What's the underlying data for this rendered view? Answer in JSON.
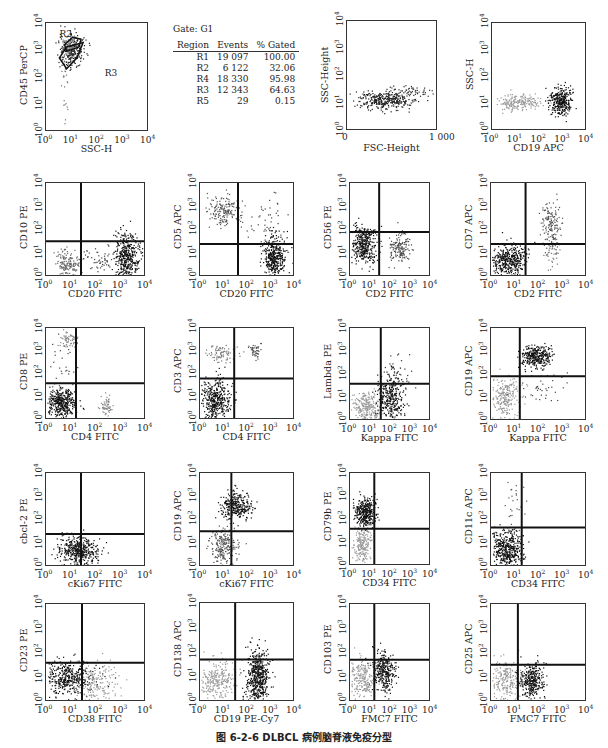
{
  "caption": "图 6-2-6   DLBCL 病例脑脊液免疫分型",
  "gate_table": {
    "title": "Gate: G1",
    "headers": [
      "Region",
      "Events",
      "% Gated"
    ],
    "rows": [
      [
        "R1",
        "19 097",
        "100.00"
      ],
      [
        "R2",
        "6 122",
        "32.06"
      ],
      [
        "R4",
        "18 330",
        "95.98"
      ],
      [
        "R3",
        "12 343",
        "64.63"
      ],
      [
        "R5",
        "29",
        "0.15"
      ]
    ]
  },
  "chart_data": [
    {
      "id": "p1",
      "type": "scatter",
      "xlabel": "SSC-H",
      "ylabel": "CD45 PerCP",
      "xscale": "log",
      "xlim": [
        1,
        10000
      ],
      "ylim": [
        1,
        10000
      ],
      "x_ticks": [
        "10^0",
        "10^1",
        "10^2",
        "10^3",
        "10^4"
      ],
      "y_ticks": [
        "10^0",
        "10^1",
        "10^2",
        "10^3",
        "10^4"
      ],
      "frame": [
        45,
        22,
        103,
        109
      ],
      "gate_labels": [
        {
          "text": "R2",
          "x": 0.14,
          "y": 0.12
        },
        {
          "text": "R3",
          "x": 0.58,
          "y": 0.48
        }
      ],
      "clusters": [
        {
          "cx": 0.25,
          "cy": 0.25,
          "sx": 0.06,
          "sy": 0.08,
          "n": 260,
          "c": "#222"
        },
        {
          "cx": 0.22,
          "cy": 0.2,
          "sx": 0.04,
          "sy": 0.04,
          "n": 80,
          "c": "#888"
        },
        {
          "cx": 0.18,
          "cy": 0.55,
          "sx": 0.02,
          "sy": 0.2,
          "n": 20,
          "c": "#777"
        }
      ],
      "quadrant": null
    },
    {
      "id": "p2",
      "type": "scatter",
      "xlabel": "FSC-Height",
      "ylabel": "SSC-Height",
      "xscale": "linear",
      "xlim": [
        0,
        1000
      ],
      "ylim": [
        1,
        10000
      ],
      "x_ticks": [
        "0",
        "1 000"
      ],
      "y_ticks": [
        "10^0",
        "10^1",
        "10^2",
        "10^3",
        "10^4"
      ],
      "frame": [
        346,
        20,
        91,
        110
      ],
      "clusters": [
        {
          "cx": 0.4,
          "cy": 0.72,
          "sx": 0.15,
          "sy": 0.04,
          "n": 350,
          "c": "#222"
        },
        {
          "cx": 0.7,
          "cy": 0.64,
          "sx": 0.1,
          "sy": 0.03,
          "n": 60,
          "c": "#333"
        }
      ],
      "quadrant": null
    },
    {
      "id": "p3",
      "type": "scatter",
      "xlabel": "CD19 APC",
      "ylabel": "SSC-H",
      "xlim": [
        1,
        10000
      ],
      "ylim": [
        1,
        10000
      ],
      "x_ticks": [
        "10^0",
        "10^1",
        "10^2",
        "10^3",
        "10^4"
      ],
      "y_ticks": [
        "10^0",
        "10^1",
        "10^2",
        "10^3",
        "10^4"
      ],
      "frame": [
        491,
        22,
        95,
        108
      ],
      "clusters": [
        {
          "cx": 0.27,
          "cy": 0.73,
          "sx": 0.12,
          "sy": 0.04,
          "n": 200,
          "c": "#999"
        },
        {
          "cx": 0.72,
          "cy": 0.72,
          "sx": 0.06,
          "sy": 0.06,
          "n": 320,
          "c": "#111"
        }
      ],
      "quadrant": null
    },
    {
      "id": "p4",
      "type": "scatter",
      "xlabel": "CD20 FITC",
      "ylabel": "CD10 PE",
      "xlim": [
        1,
        10000
      ],
      "ylim": [
        1,
        10000
      ],
      "x_ticks": [
        "10^0",
        "10^1",
        "10^2",
        "10^3",
        "10^4"
      ],
      "y_ticks": [
        "10^0",
        "10^1",
        "10^2",
        "10^3",
        "10^4"
      ],
      "frame": [
        45,
        182,
        100,
        94
      ],
      "quadrant": [
        0.35,
        0.62
      ],
      "clusters": [
        {
          "cx": 0.22,
          "cy": 0.86,
          "sx": 0.07,
          "sy": 0.07,
          "n": 160,
          "c": "#666"
        },
        {
          "cx": 0.8,
          "cy": 0.78,
          "sx": 0.06,
          "sy": 0.12,
          "n": 420,
          "c": "#111"
        },
        {
          "cx": 0.55,
          "cy": 0.82,
          "sx": 0.12,
          "sy": 0.08,
          "n": 60,
          "c": "#444"
        }
      ]
    },
    {
      "id": "p5",
      "type": "scatter",
      "xlabel": "CD20 FITC",
      "ylabel": "CD5 APC",
      "xlim": [
        1,
        10000
      ],
      "ylim": [
        1,
        10000
      ],
      "x_ticks": [
        "10^0",
        "10^1",
        "10^2",
        "10^3",
        "10^4"
      ],
      "y_ticks": [
        "10^0",
        "10^1",
        "10^2",
        "10^3",
        "10^4"
      ],
      "frame": [
        199,
        182,
        95,
        94
      ],
      "quadrant": [
        0.4,
        0.65
      ],
      "clusters": [
        {
          "cx": 0.25,
          "cy": 0.3,
          "sx": 0.09,
          "sy": 0.08,
          "n": 180,
          "c": "#555"
        },
        {
          "cx": 0.78,
          "cy": 0.8,
          "sx": 0.06,
          "sy": 0.12,
          "n": 400,
          "c": "#111"
        },
        {
          "cx": 0.7,
          "cy": 0.35,
          "sx": 0.12,
          "sy": 0.12,
          "n": 40,
          "c": "#444"
        }
      ]
    },
    {
      "id": "p6",
      "type": "scatter",
      "xlabel": "CD2 FITC",
      "ylabel": "CD56 PE",
      "xlim": [
        1,
        10000
      ],
      "ylim": [
        1,
        10000
      ],
      "x_ticks": [
        "10^0",
        "10^1",
        "10^2",
        "10^3",
        "10^4"
      ],
      "y_ticks": [
        "10^0",
        "10^1",
        "10^2",
        "10^3",
        "10^4"
      ],
      "frame": [
        349,
        182,
        81,
        94
      ],
      "quadrant": [
        0.36,
        0.52
      ],
      "clusters": [
        {
          "cx": 0.17,
          "cy": 0.65,
          "sx": 0.08,
          "sy": 0.1,
          "n": 380,
          "c": "#111"
        },
        {
          "cx": 0.6,
          "cy": 0.68,
          "sx": 0.06,
          "sy": 0.08,
          "n": 140,
          "c": "#444"
        }
      ]
    },
    {
      "id": "p7",
      "type": "scatter",
      "xlabel": "CD2 FITC",
      "ylabel": "CD7 APC",
      "xlim": [
        1,
        10000
      ],
      "ylim": [
        1,
        10000
      ],
      "x_ticks": [
        "10^0",
        "10^1",
        "10^2",
        "10^3",
        "10^4"
      ],
      "y_ticks": [
        "10^0",
        "10^1",
        "10^2",
        "10^3",
        "10^4"
      ],
      "frame": [
        490,
        182,
        96,
        94
      ],
      "quadrant": [
        0.36,
        0.65
      ],
      "clusters": [
        {
          "cx": 0.18,
          "cy": 0.82,
          "sx": 0.09,
          "sy": 0.08,
          "n": 420,
          "c": "#111"
        },
        {
          "cx": 0.62,
          "cy": 0.42,
          "sx": 0.05,
          "sy": 0.12,
          "n": 150,
          "c": "#555"
        },
        {
          "cx": 0.62,
          "cy": 0.72,
          "sx": 0.04,
          "sy": 0.1,
          "n": 50,
          "c": "#777"
        }
      ]
    },
    {
      "id": "p8",
      "type": "scatter",
      "xlabel": "CD4 FITC",
      "ylabel": "CD8 PE",
      "xlim": [
        1,
        10000
      ],
      "ylim": [
        1,
        10000
      ],
      "x_ticks": [
        "10^0",
        "10^1",
        "10^2",
        "10^3",
        "10^4"
      ],
      "y_ticks": [
        "10^0",
        "10^1",
        "10^2",
        "10^3",
        "10^4"
      ],
      "frame": [
        45,
        327,
        100,
        92
      ],
      "quadrant": [
        0.3,
        0.6
      ],
      "clusters": [
        {
          "cx": 0.15,
          "cy": 0.8,
          "sx": 0.07,
          "sy": 0.08,
          "n": 400,
          "c": "#111"
        },
        {
          "cx": 0.22,
          "cy": 0.12,
          "sx": 0.06,
          "sy": 0.05,
          "n": 70,
          "c": "#888"
        },
        {
          "cx": 0.6,
          "cy": 0.82,
          "sx": 0.03,
          "sy": 0.07,
          "n": 60,
          "c": "#888"
        },
        {
          "cx": 0.15,
          "cy": 0.4,
          "sx": 0.08,
          "sy": 0.15,
          "n": 30,
          "c": "#444"
        }
      ]
    },
    {
      "id": "p9",
      "type": "scatter",
      "xlabel": "CD4 FITC",
      "ylabel": "CD3 APC",
      "xlim": [
        1,
        10000
      ],
      "ylim": [
        1,
        10000
      ],
      "x_ticks": [
        "10^0",
        "10^1",
        "10^2",
        "10^3",
        "10^4"
      ],
      "y_ticks": [
        "10^0",
        "10^1",
        "10^2",
        "10^3",
        "10^4"
      ],
      "frame": [
        199,
        327,
        95,
        92
      ],
      "quadrant": [
        0.36,
        0.55
      ],
      "clusters": [
        {
          "cx": 0.15,
          "cy": 0.78,
          "sx": 0.08,
          "sy": 0.12,
          "n": 420,
          "c": "#111"
        },
        {
          "cx": 0.22,
          "cy": 0.28,
          "sx": 0.08,
          "sy": 0.05,
          "n": 80,
          "c": "#777"
        },
        {
          "cx": 0.57,
          "cy": 0.25,
          "sx": 0.03,
          "sy": 0.05,
          "n": 50,
          "c": "#555"
        }
      ]
    },
    {
      "id": "p10",
      "type": "scatter",
      "xlabel": "Kappa FITC",
      "ylabel": "Lambda PE",
      "xlim": [
        1,
        10000
      ],
      "ylim": [
        1,
        10000
      ],
      "x_ticks": [
        "10^0",
        "10^1",
        "10^2",
        "10^3",
        "10^4"
      ],
      "y_ticks": [
        "10^0",
        "10^1",
        "10^2",
        "10^3",
        "10^4"
      ],
      "frame": [
        349,
        327,
        81,
        93
      ],
      "quadrant": [
        0.38,
        0.6
      ],
      "clusters": [
        {
          "cx": 0.2,
          "cy": 0.85,
          "sx": 0.1,
          "sy": 0.08,
          "n": 260,
          "c": "#999"
        },
        {
          "cx": 0.5,
          "cy": 0.75,
          "sx": 0.08,
          "sy": 0.12,
          "n": 320,
          "c": "#111"
        },
        {
          "cx": 0.6,
          "cy": 0.5,
          "sx": 0.08,
          "sy": 0.1,
          "n": 40,
          "c": "#333"
        }
      ]
    },
    {
      "id": "p11",
      "type": "scatter",
      "xlabel": "Kappa FITC",
      "ylabel": "CD19 APC",
      "xlim": [
        1,
        10000
      ],
      "ylim": [
        1,
        10000
      ],
      "x_ticks": [
        "10^0",
        "10^1",
        "10^2",
        "10^3",
        "10^4"
      ],
      "y_ticks": [
        "10^0",
        "10^1",
        "10^2",
        "10^3",
        "10^4"
      ],
      "frame": [
        490,
        327,
        96,
        93
      ],
      "quadrant": [
        0.3,
        0.52
      ],
      "clusters": [
        {
          "cx": 0.15,
          "cy": 0.75,
          "sx": 0.08,
          "sy": 0.12,
          "n": 260,
          "c": "#999"
        },
        {
          "cx": 0.47,
          "cy": 0.3,
          "sx": 0.08,
          "sy": 0.06,
          "n": 320,
          "c": "#111"
        },
        {
          "cx": 0.55,
          "cy": 0.62,
          "sx": 0.12,
          "sy": 0.1,
          "n": 40,
          "c": "#444"
        }
      ]
    },
    {
      "id": "p12",
      "type": "scatter",
      "xlabel": "cKi67 FITC",
      "ylabel": "cbcl-2 PE",
      "xlim": [
        1,
        10000
      ],
      "ylim": [
        1,
        10000
      ],
      "x_ticks": [
        "10^0",
        "10^1",
        "10^2",
        "10^3",
        "10^4"
      ],
      "y_ticks": [
        "10^0",
        "10^1",
        "10^2",
        "10^3",
        "10^4"
      ],
      "frame": [
        45,
        472,
        100,
        94
      ],
      "quadrant": [
        0.35,
        0.65
      ],
      "clusters": [
        {
          "cx": 0.32,
          "cy": 0.82,
          "sx": 0.1,
          "sy": 0.07,
          "n": 420,
          "c": "#111"
        }
      ]
    },
    {
      "id": "p13",
      "type": "scatter",
      "xlabel": "cKi67 FITC",
      "ylabel": "CD19 APC",
      "xlim": [
        1,
        10000
      ],
      "ylim": [
        1,
        10000
      ],
      "x_ticks": [
        "10^0",
        "10^1",
        "10^2",
        "10^3",
        "10^4"
      ],
      "y_ticks": [
        "10^0",
        "10^1",
        "10^2",
        "10^3",
        "10^4"
      ],
      "frame": [
        199,
        472,
        95,
        94
      ],
      "quadrant": [
        0.33,
        0.62
      ],
      "clusters": [
        {
          "cx": 0.37,
          "cy": 0.35,
          "sx": 0.08,
          "sy": 0.07,
          "n": 300,
          "c": "#111"
        },
        {
          "cx": 0.25,
          "cy": 0.78,
          "sx": 0.07,
          "sy": 0.1,
          "n": 220,
          "c": "#555"
        }
      ]
    },
    {
      "id": "p14",
      "type": "scatter",
      "xlabel": "CD34 FITC",
      "ylabel": "CD79b PE",
      "xlim": [
        1,
        10000
      ],
      "ylim": [
        1,
        10000
      ],
      "x_ticks": [
        "10^0",
        "10^1",
        "10^2",
        "10^3",
        "10^4"
      ],
      "y_ticks": [
        "10^0",
        "10^1",
        "10^2",
        "10^3",
        "10^4"
      ],
      "frame": [
        349,
        472,
        81,
        93
      ],
      "quadrant": [
        0.3,
        0.6
      ],
      "clusters": [
        {
          "cx": 0.18,
          "cy": 0.42,
          "sx": 0.06,
          "sy": 0.08,
          "n": 360,
          "c": "#111"
        },
        {
          "cx": 0.15,
          "cy": 0.78,
          "sx": 0.05,
          "sy": 0.1,
          "n": 200,
          "c": "#999"
        }
      ]
    },
    {
      "id": "p15",
      "type": "scatter",
      "xlabel": "CD34 FITC",
      "ylabel": "CD11c APC",
      "xlim": [
        1,
        10000
      ],
      "ylim": [
        1,
        10000
      ],
      "x_ticks": [
        "10^0",
        "10^1",
        "10^2",
        "10^3",
        "10^4"
      ],
      "y_ticks": [
        "10^0",
        "10^1",
        "10^2",
        "10^3",
        "10^4"
      ],
      "frame": [
        490,
        472,
        96,
        94
      ],
      "quadrant": [
        0.32,
        0.58
      ],
      "clusters": [
        {
          "cx": 0.16,
          "cy": 0.8,
          "sx": 0.08,
          "sy": 0.1,
          "n": 440,
          "c": "#111"
        },
        {
          "cx": 0.2,
          "cy": 0.35,
          "sx": 0.05,
          "sy": 0.15,
          "n": 25,
          "c": "#555"
        }
      ]
    },
    {
      "id": "p16",
      "type": "scatter",
      "xlabel": "CD38 FITC",
      "ylabel": "CD23 PE",
      "xlim": [
        1,
        10000
      ],
      "ylim": [
        1,
        10000
      ],
      "x_ticks": [
        "10^0",
        "10^1",
        "10^2",
        "10^3",
        "10^4"
      ],
      "y_ticks": [
        "10^0",
        "10^1",
        "10^2",
        "10^3",
        "10^4"
      ],
      "frame": [
        45,
        603,
        100,
        98
      ],
      "quadrant": [
        0.36,
        0.6
      ],
      "clusters": [
        {
          "cx": 0.22,
          "cy": 0.75,
          "sx": 0.13,
          "sy": 0.08,
          "n": 420,
          "c": "#111"
        },
        {
          "cx": 0.5,
          "cy": 0.8,
          "sx": 0.1,
          "sy": 0.1,
          "n": 160,
          "c": "#999"
        }
      ]
    },
    {
      "id": "p17",
      "type": "scatter",
      "xlabel": "CD19 PE-Cy7",
      "ylabel": "CD138 APC",
      "xlim": [
        1,
        10000
      ],
      "ylim": [
        1,
        10000
      ],
      "x_ticks": [
        "10^0",
        "10^1",
        "10^2",
        "10^3",
        "10^4"
      ],
      "y_ticks": [
        "10^0",
        "10^1",
        "10^2",
        "10^3",
        "10^4"
      ],
      "frame": [
        199,
        602,
        95,
        99
      ],
      "quadrant": [
        0.37,
        0.57
      ],
      "clusters": [
        {
          "cx": 0.17,
          "cy": 0.77,
          "sx": 0.1,
          "sy": 0.1,
          "n": 260,
          "c": "#999"
        },
        {
          "cx": 0.6,
          "cy": 0.75,
          "sx": 0.06,
          "sy": 0.13,
          "n": 520,
          "c": "#111"
        }
      ]
    },
    {
      "id": "p18",
      "type": "scatter",
      "xlabel": "FMC7 FITC",
      "ylabel": "CD103 PE",
      "xlim": [
        1,
        10000
      ],
      "ylim": [
        1,
        10000
      ],
      "x_ticks": [
        "10^0",
        "10^1",
        "10^2",
        "10^3",
        "10^4"
      ],
      "y_ticks": [
        "10^0",
        "10^1",
        "10^2",
        "10^3",
        "10^4"
      ],
      "frame": [
        349,
        603,
        81,
        98
      ],
      "quadrant": [
        0.3,
        0.57
      ],
      "clusters": [
        {
          "cx": 0.15,
          "cy": 0.75,
          "sx": 0.08,
          "sy": 0.1,
          "n": 220,
          "c": "#999"
        },
        {
          "cx": 0.42,
          "cy": 0.68,
          "sx": 0.07,
          "sy": 0.1,
          "n": 300,
          "c": "#111"
        }
      ]
    },
    {
      "id": "p19",
      "type": "scatter",
      "xlabel": "FMC7 FITC",
      "ylabel": "CD25 APC",
      "xlim": [
        1,
        10000
      ],
      "ylim": [
        1,
        10000
      ],
      "x_ticks": [
        "10^0",
        "10^1",
        "10^2",
        "10^3",
        "10^4"
      ],
      "y_ticks": [
        "10^0",
        "10^1",
        "10^2",
        "10^3",
        "10^4"
      ],
      "frame": [
        490,
        603,
        96,
        98
      ],
      "quadrant": [
        0.28,
        0.62
      ],
      "clusters": [
        {
          "cx": 0.15,
          "cy": 0.78,
          "sx": 0.08,
          "sy": 0.1,
          "n": 220,
          "c": "#999"
        },
        {
          "cx": 0.42,
          "cy": 0.78,
          "sx": 0.07,
          "sy": 0.09,
          "n": 320,
          "c": "#111"
        }
      ]
    }
  ]
}
